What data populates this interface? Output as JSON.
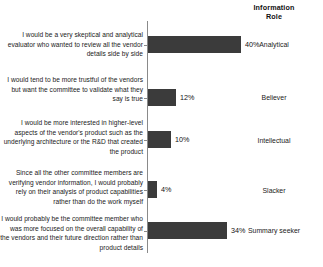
{
  "header": {
    "column_title_line1": "Information",
    "column_title_line2": "Role"
  },
  "chart_data": {
    "type": "bar",
    "orientation": "horizontal",
    "title": "",
    "subtitle": "",
    "xlabel": "",
    "ylabel": "",
    "xlim": [
      0,
      45
    ],
    "grid": false,
    "legend": "none",
    "value_suffix": "%",
    "bar_color": "#3b3b3b",
    "categories": [
      "I would be a very skeptical and analytical evaluator who wanted to review all the vendor details side by side",
      "I would tend to be more trustful of the vendors but want the committee to validate what they say is true",
      "I would be more interested in higher-level aspects of the vendor's product such as the underlying architecture or the R&D that created the product",
      "Since all the other committee members are verifying vendor information, I would probably rely on their analysis of product capabilities rather than do the work myself",
      "I would probably be the committee member who was more focused on the overall capability of the vendors and their future direction rather than product details"
    ],
    "values": [
      40,
      12,
      10,
      4,
      34
    ],
    "value_labels": [
      "40%",
      "12%",
      "10%",
      "4%",
      "34%"
    ],
    "role_labels": [
      "Analytical",
      "Believer",
      "Intellectual",
      "Slacker",
      "Summary seeker"
    ]
  },
  "rows": [
    {
      "statement": "I would be a very skeptical and analytical evaluator who wanted to review all the vendor details side by side",
      "value": 40,
      "value_label": "40%",
      "role": "Analytical"
    },
    {
      "statement": "I would tend to be more trustful of the vendors but want the committee to validate what they say is true",
      "value": 12,
      "value_label": "12%",
      "role": "Believer"
    },
    {
      "statement": "I would be more interested in higher-level aspects of the vendor's product such as the underlying architecture or the R&D that created the product",
      "value": 10,
      "value_label": "10%",
      "role": "Intellectual"
    },
    {
      "statement": "Since all the other committee members are verifying vendor information, I would probably rely on their analysis of product capabilities rather than do the work myself",
      "value": 4,
      "value_label": "4%",
      "role": "Slacker"
    },
    {
      "statement": "I would probably be the committee member who was more focused on the overall capability of the vendors and their future direction rather than product details",
      "value": 34,
      "value_label": "34%",
      "role": "Summary seeker"
    }
  ]
}
